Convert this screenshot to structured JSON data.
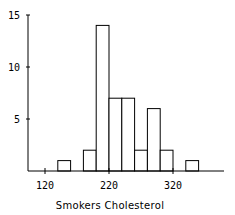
{
  "chart_data": {
    "type": "bar",
    "title": "",
    "xlabel": "Smokers Cholesterol",
    "ylabel": "",
    "bins": [
      {
        "start": 140,
        "end": 160,
        "count": 1
      },
      {
        "start": 180,
        "end": 200,
        "count": 2
      },
      {
        "start": 200,
        "end": 220,
        "count": 14
      },
      {
        "start": 220,
        "end": 240,
        "count": 7
      },
      {
        "start": 240,
        "end": 260,
        "count": 7
      },
      {
        "start": 260,
        "end": 280,
        "count": 2
      },
      {
        "start": 280,
        "end": 300,
        "count": 6
      },
      {
        "start": 300,
        "end": 320,
        "count": 2
      },
      {
        "start": 340,
        "end": 360,
        "count": 1
      }
    ],
    "categories": [
      "140-160",
      "180-200",
      "200-220",
      "220-240",
      "240-260",
      "260-280",
      "280-300",
      "300-320",
      "340-360"
    ],
    "values": [
      1,
      2,
      14,
      7,
      7,
      2,
      6,
      2,
      1
    ],
    "x_ticks": [
      "120",
      "220",
      "320"
    ],
    "y_ticks": [
      "5",
      "10",
      "15"
    ],
    "xlim": [
      90,
      395
    ],
    "ylim": [
      0,
      15
    ],
    "grid": false,
    "legend": null
  },
  "labels": {
    "xlabel": "Smokers Cholesterol",
    "x_tick_120": "120",
    "x_tick_220": "220",
    "x_tick_320": "320",
    "y_tick_5": "5",
    "y_tick_10": "10",
    "y_tick_15": "15"
  }
}
